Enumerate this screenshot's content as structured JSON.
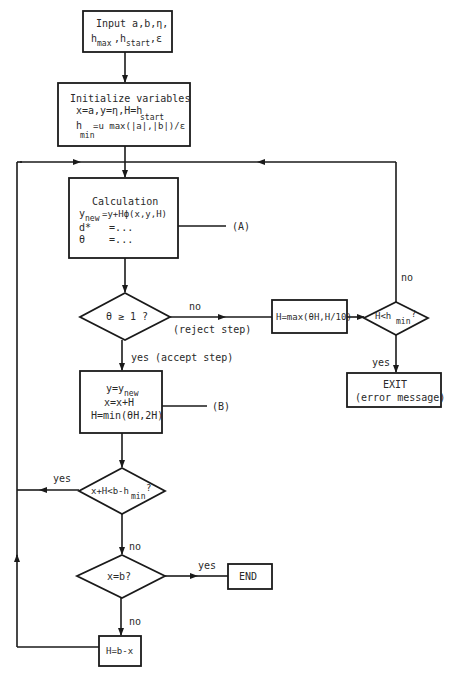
{
  "nodes": {
    "input": {
      "line1": "Input a,b,η,",
      "line2_a": "h",
      "line2_a_sub": "max",
      "line2_b": ",h",
      "line2_b_sub": "start",
      "line2_c": ",ε"
    },
    "init": {
      "title": "Initialize variables",
      "line1": "x=a,y=η,H=h",
      "line1_sub": "start",
      "line2_a": "h",
      "line2_a_sub": "min",
      "line2_b": "=u max(|a|,|b|)/ε"
    },
    "calc": {
      "title": "Calculation",
      "line1_a": "y",
      "line1_a_sub": "new",
      "line1_b": "=y+Hϕ(x,y,H)",
      "line2": "d*   =...",
      "line3": "θ    =..."
    },
    "theta_check": {
      "text": "θ ≥ 1 ?"
    },
    "reject_box": {
      "text": "H=max(θH,H/10)"
    },
    "hmin_check": {
      "text_a": "H<h",
      "text_sub": "min",
      "text_b": "?"
    },
    "exit_box": {
      "line1": "EXIT",
      "line2": "(error message)"
    },
    "accept_box": {
      "line1_a": "y=y",
      "line1_sub": "new",
      "line2": "x=x+H",
      "line3": "H=min(θH,2H)"
    },
    "step_check": {
      "text_a": "x+H<b-h",
      "text_sub": "min",
      "text_b": "?"
    },
    "end_check": {
      "text": "x=b?"
    },
    "end_box": {
      "text": "END"
    },
    "last_step_box": {
      "text": "H=b-x"
    }
  },
  "labels": {
    "ref_a": "(A)",
    "ref_b": "(B)",
    "theta_no": "no",
    "theta_no_note": "(reject step)",
    "theta_yes": "yes (accept step)",
    "hmin_no": "no",
    "hmin_yes": "yes",
    "step_yes": "yes",
    "step_no": "no",
    "end_yes": "yes",
    "end_no": "no"
  }
}
